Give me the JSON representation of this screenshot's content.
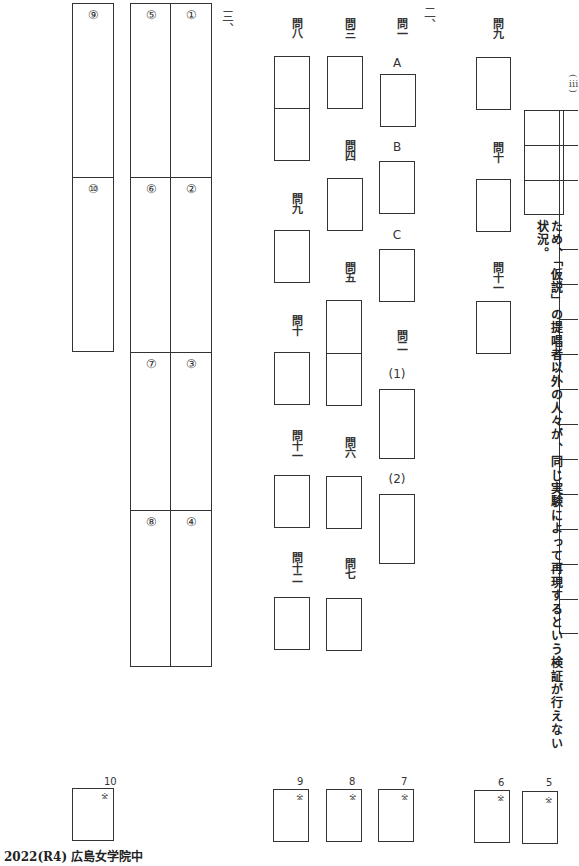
{
  "sections": {
    "san": "三、",
    "ni": "二、"
  },
  "section3": {
    "cells": [
      "①",
      "②",
      "③",
      "④",
      "⑤",
      "⑥",
      "⑦",
      "⑧",
      "⑨",
      "⑩"
    ]
  },
  "section2": {
    "questions": {
      "q1": "問一",
      "q1_a": "A",
      "q1_b": "B",
      "q1_c": "C",
      "q2": "問二",
      "q2_1": "(1)",
      "q2_2": "(2)",
      "q3": "問三",
      "q4": "問四",
      "q5": "問五",
      "q6": "問六",
      "q7": "問七",
      "q8": "問八",
      "q9": "問九",
      "q10": "問十",
      "q11": "問十一",
      "q12": "問十二"
    }
  },
  "section1_tail": {
    "q9": "問九",
    "q10": "問十",
    "q11": "問十一",
    "partial_label": "(ⅲ)",
    "answer_text": "ため、「仮説」の提唱者以外の人々が、同じ実験によって再現するという検証が行えない状況。"
  },
  "score_boxes": [
    {
      "num": "10",
      "mark": "※"
    },
    {
      "num": "9",
      "mark": "※"
    },
    {
      "num": "8",
      "mark": "※"
    },
    {
      "num": "7",
      "mark": "※"
    },
    {
      "num": "6",
      "mark": "※"
    },
    {
      "num": "5",
      "mark": "※"
    }
  ],
  "footer": {
    "text": "2022(R4) 広島女学院中"
  }
}
